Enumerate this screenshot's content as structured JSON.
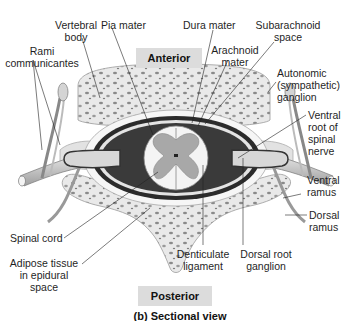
{
  "figure": {
    "orientation_top": "Anterior",
    "orientation_bottom": "Posterior",
    "caption": "(b) Sectional view"
  },
  "labels": {
    "vertebral_body": [
      "Vertebral",
      "body"
    ],
    "pia_mater": [
      "Pia mater"
    ],
    "dura_mater": [
      "Dura mater"
    ],
    "subarachnoid_space": [
      "Subarachnoid",
      "space"
    ],
    "arachnoid_mater": [
      "Arachnoid",
      "mater"
    ],
    "rami_communicantes": [
      "Rami",
      "communicantes"
    ],
    "autonomic_ganglion": [
      "Autonomic",
      "(sympathetic)",
      "ganglion"
    ],
    "ventral_root": [
      "Ventral",
      "root of",
      "spinal",
      "nerve"
    ],
    "ventral_ramus": [
      "Ventral",
      "ramus"
    ],
    "dorsal_ramus": [
      "Dorsal",
      "ramus"
    ],
    "spinal_cord": [
      "Spinal cord"
    ],
    "adipose_tissue": [
      "Adipose tissue",
      "in epidural",
      "space"
    ],
    "denticulate_ligament": [
      "Denticulate",
      "ligament"
    ],
    "dorsal_root_ganglion": [
      "Dorsal root",
      "ganglion"
    ]
  },
  "colors": {
    "bone": "#e9e9e9",
    "bone_spot": "#8a8a8a",
    "dura": "#2b2b2b",
    "nerve": "#cfcfcf",
    "gray_matter": "#a8a8a8",
    "white_matter": "#f4f4f4",
    "tag_bg": "#dcdcdc"
  }
}
